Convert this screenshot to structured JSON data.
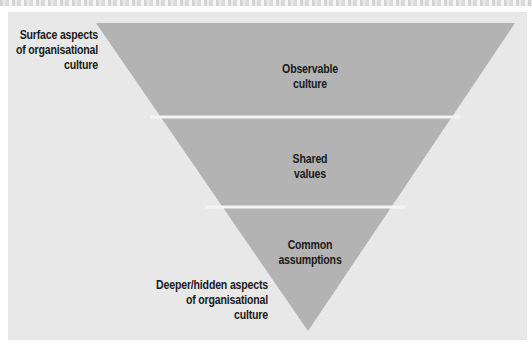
{
  "figure": {
    "background_color": "#e8e8e8",
    "triangle_color": "#b3b3b3",
    "separator_color": "#f4f4f4",
    "layers": [
      {
        "label_line1": "Observable",
        "label_line2": "culture"
      },
      {
        "label_line1": "Shared",
        "label_line2": "values"
      },
      {
        "label_line1": "Common",
        "label_line2": "assumptions"
      }
    ],
    "side_labels": {
      "top": {
        "line1": "Surface aspects",
        "line2": "of organisational",
        "line3": "culture"
      },
      "bottom": {
        "line1": "Deeper/hidden aspects",
        "line2": "of organisational",
        "line3": "culture"
      }
    }
  }
}
